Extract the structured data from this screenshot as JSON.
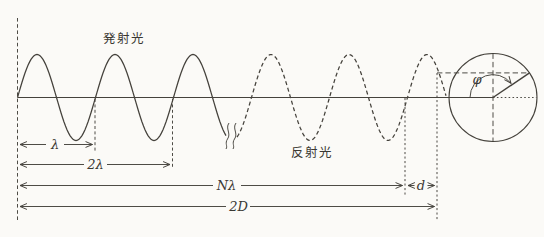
{
  "labels": {
    "emitted_light": "発射光",
    "reflected_light": "反射光",
    "lambda": "λ",
    "two_lambda": "2λ",
    "n_lambda": "Nλ",
    "d": "d",
    "two_d": "2D",
    "phi": "φ"
  },
  "waveform": {
    "start_x": 17.5,
    "axis_y": 97.5,
    "amplitude_px": 43,
    "wavelength_px": 78,
    "solid_segment": [
      17.5,
      226
    ],
    "dashed_segment": [
      237,
      446
    ]
  },
  "phasor": {
    "center_x": 493,
    "center_y": 97.5,
    "radius": 44,
    "angle_deg": 34,
    "arc_radius": 23
  },
  "colors": {
    "ink": "#45423c",
    "text": "#3a3833",
    "background": "#fbfaf7"
  }
}
